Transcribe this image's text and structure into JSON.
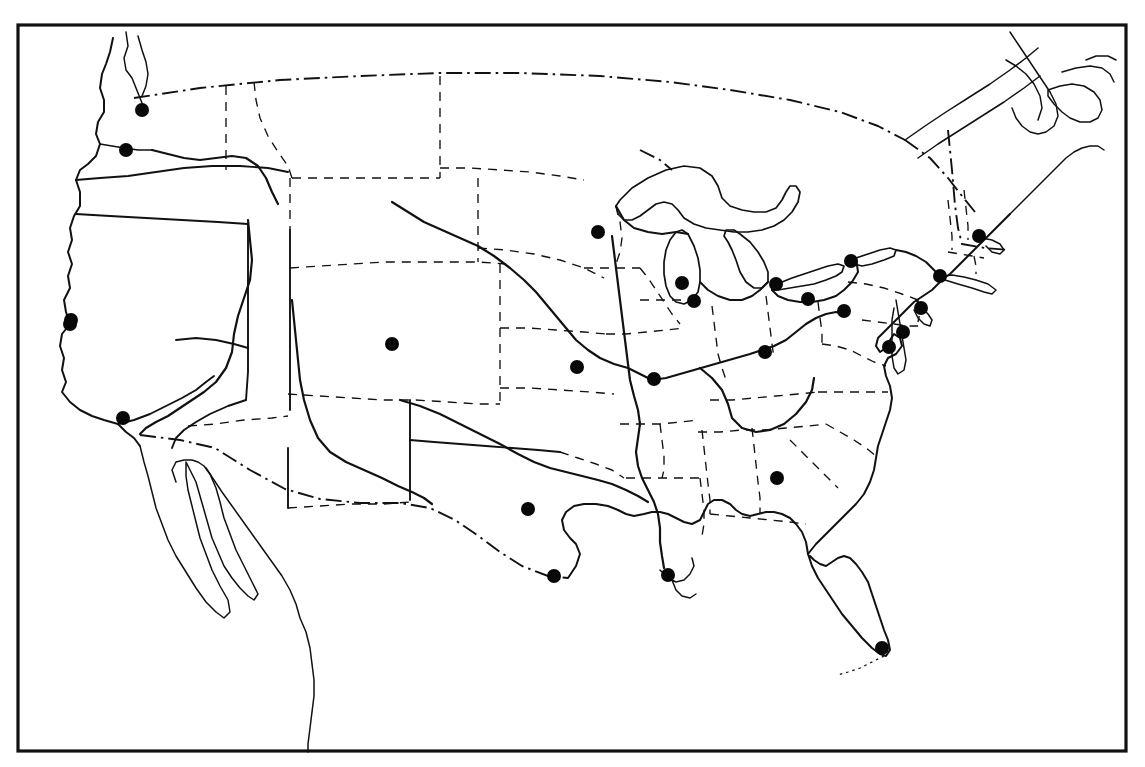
{
  "figure": {
    "kind": "map",
    "region": "Contiguous United States",
    "style": "black-and-white line art outline map",
    "frame": {
      "x": 18,
      "y": 25,
      "width": 1108,
      "height": 726,
      "stroke_color": "#111111"
    },
    "marker": {
      "shape": "filled-circle",
      "color": "#080808",
      "radius": 7
    }
  },
  "legend_lines": [
    {
      "name": "national-coastline",
      "style": "solid-heavy"
    },
    {
      "name": "international-border",
      "style": "dash-dot"
    },
    {
      "name": "state-border",
      "style": "dashed"
    },
    {
      "name": "major-river",
      "style": "solid-heavy"
    },
    {
      "name": "great-lakes-shoreline",
      "style": "solid"
    }
  ],
  "chart_data": {
    "type": "scatter",
    "title": "",
    "xlabel": "",
    "ylabel": "",
    "projection": "conic-like United States base map",
    "marker_count": 26,
    "points": [
      {
        "label": "Seattle",
        "x": 142,
        "y": 110
      },
      {
        "label": "Portland",
        "x": 126,
        "y": 150
      },
      {
        "label": "San Francisco",
        "x": 70,
        "y": 324
      },
      {
        "label": "Los Angeles",
        "x": 123,
        "y": 418
      },
      {
        "label": "Denver",
        "x": 392,
        "y": 344
      },
      {
        "label": "Minneapolis",
        "x": 598,
        "y": 232
      },
      {
        "label": "Kansas City",
        "x": 577,
        "y": 367
      },
      {
        "label": "St. Louis",
        "x": 654,
        "y": 379
      },
      {
        "label": "Chicago",
        "x": 694,
        "y": 301
      },
      {
        "label": "Milwaukee",
        "x": 682,
        "y": 283
      },
      {
        "label": "Detroit",
        "x": 776,
        "y": 284
      },
      {
        "label": "Cleveland",
        "x": 808,
        "y": 299
      },
      {
        "label": "Buffalo",
        "x": 851,
        "y": 261
      },
      {
        "label": "Pittsburgh",
        "x": 844,
        "y": 311
      },
      {
        "label": "Cincinnati",
        "x": 765,
        "y": 352
      },
      {
        "label": "Boston",
        "x": 979,
        "y": 236
      },
      {
        "label": "New York",
        "x": 940,
        "y": 276
      },
      {
        "label": "Philadelphia",
        "x": 921,
        "y": 308
      },
      {
        "label": "Baltimore",
        "x": 903,
        "y": 332
      },
      {
        "label": "Washington DC",
        "x": 889,
        "y": 347
      },
      {
        "label": "Atlanta",
        "x": 777,
        "y": 478
      },
      {
        "label": "Dallas",
        "x": 528,
        "y": 509
      },
      {
        "label": "Houston",
        "x": 554,
        "y": 576
      },
      {
        "label": "New Orleans",
        "x": 668,
        "y": 575
      },
      {
        "label": "Miami",
        "x": 882,
        "y": 648
      },
      {
        "label": "Sacramento",
        "x": 71,
        "y": 320
      }
    ]
  }
}
